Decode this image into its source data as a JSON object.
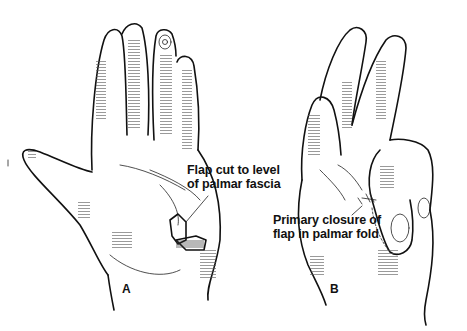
{
  "figure": {
    "panels": [
      {
        "id": "A",
        "letter": "A",
        "callout": {
          "line1": "Flap cut to level",
          "line2": "of palmar fascia"
        }
      },
      {
        "id": "B",
        "letter": "B",
        "callout": {
          "line1": "Primary closure of",
          "line2": "flap in palmar fold"
        }
      }
    ],
    "colors": {
      "ink": "#111111",
      "background": "#ffffff"
    }
  }
}
